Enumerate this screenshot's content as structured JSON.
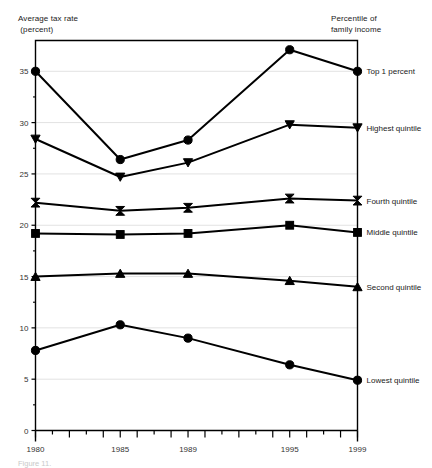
{
  "figure": {
    "axis_title_left": "Average tax rate\n (percent)",
    "axis_title_right": "Percentile of\nfamily income",
    "footnote": "Figure 11."
  },
  "chart_data": {
    "type": "line",
    "title": "",
    "subtitle": "",
    "xlabel": "",
    "ylabel": "Average tax rate (percent)",
    "legend_title": "Percentile of family income",
    "legend_position": "right-inline",
    "grid": true,
    "x": [
      1980,
      1985,
      1989,
      1995,
      1999
    ],
    "xlim": [
      1980,
      1999
    ],
    "ylim": [
      0,
      38
    ],
    "x_tick_labels": [
      "1980",
      "1985",
      "1989",
      "1995",
      "1999"
    ],
    "x_tick_label_values": [
      1980,
      1985,
      1989,
      1995,
      1999
    ],
    "x_all_ticks": [
      1980,
      1981,
      1982,
      1983,
      1984,
      1985,
      1986,
      1987,
      1988,
      1989,
      1990,
      1991,
      1992,
      1993,
      1994,
      1995,
      1996,
      1997,
      1998,
      1999
    ],
    "y_tick_labels": [
      "0",
      "5",
      "10",
      "15",
      "20",
      "25",
      "30",
      "35"
    ],
    "y_tick_values": [
      0,
      5,
      10,
      15,
      20,
      25,
      30,
      35
    ],
    "y_minor_ticks": [
      2.5,
      7.5,
      12.5,
      17.5,
      22.5,
      27.5,
      32.5
    ],
    "series": [
      {
        "name": "Top 1 percent",
        "marker": "circle",
        "values": [
          35.0,
          26.4,
          28.3,
          37.1,
          35.0
        ]
      },
      {
        "name": "Highest quintile",
        "marker": "triangle-down",
        "values": [
          28.4,
          24.7,
          26.1,
          29.8,
          29.5
        ]
      },
      {
        "name": "Fourth quintile",
        "marker": "bowtie",
        "values": [
          22.2,
          21.4,
          21.7,
          22.6,
          22.4
        ]
      },
      {
        "name": "Middle quintile",
        "marker": "square",
        "values": [
          19.2,
          19.1,
          19.2,
          20.0,
          19.3
        ]
      },
      {
        "name": "Second quintile",
        "marker": "triangle-up",
        "values": [
          15.0,
          15.3,
          15.3,
          14.6,
          14.0
        ]
      },
      {
        "name": "Lowest quintile",
        "marker": "circle",
        "values": [
          7.8,
          10.3,
          9.0,
          6.4,
          4.9
        ]
      }
    ],
    "colors": {
      "line": "#000000",
      "marker": "#000000",
      "grid": "#e2e2e2",
      "axis": "#000000",
      "background": "#ffffff"
    }
  }
}
